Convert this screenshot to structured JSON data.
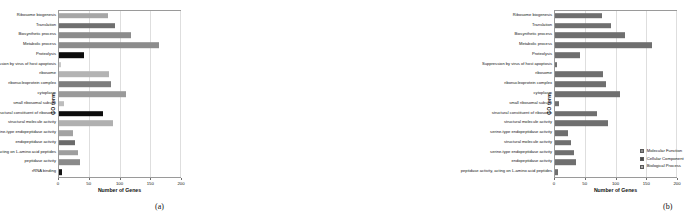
{
  "figure": {
    "panels": [
      {
        "id": "a",
        "caption": "(a)",
        "xlabel": "Number of Genes",
        "ylabel": "GO term"
      },
      {
        "id": "b",
        "caption": "(b)",
        "xlabel": "Number of Genes",
        "ylabel": "GO term"
      }
    ]
  },
  "legend": {
    "entries": [
      {
        "label": "Molecular Function",
        "color": "#8d8d8d"
      },
      {
        "label": "Cellular Component",
        "color": "#4a4a4a"
      },
      {
        "label": "Biological Process",
        "color": "#a8a8a8"
      }
    ]
  },
  "chart_data": [
    {
      "type": "bar",
      "orientation": "horizontal",
      "panel": "a",
      "title": "",
      "xlabel": "Number of Genes",
      "ylabel": "GO term",
      "xlim": [
        0,
        200
      ],
      "xticks": [
        0,
        50,
        100,
        150,
        200
      ],
      "grid": true,
      "legend_position": "none",
      "categories": [
        "Ribosome biogenesis",
        "Translation",
        "Biosynthetic process",
        "Metabolic process",
        "Proteolysis",
        "Suppression by virus of host apoptosis",
        "ribosome",
        "ribonucleoprotein complex",
        "cytoplasm",
        "small ribosomal subunit",
        "structural constituent of ribosome",
        "structural molecule activity",
        "serine-type endopeptidase activity",
        "endopeptidase activity",
        "peptidase activity, acting on L-amino acid peptides",
        "peptidase activity",
        "rRNA binding"
      ],
      "values": [
        81,
        93,
        119,
        165,
        42,
        3,
        83,
        86,
        110,
        9,
        72,
        89,
        23,
        27,
        32,
        35,
        5
      ],
      "bar_colors": [
        "#a6a6a6",
        "#6f6f6f",
        "#8c8c8c",
        "#8c8c8c",
        "#0d0d0d",
        "#c9c9c9",
        "#b3b3b3",
        "#7d7d7d",
        "#9a9a9a",
        "#bdbdbd",
        "#0d0d0d",
        "#b0b0b0",
        "#a2a2a2",
        "#6b6b6b",
        "#9e9e9e",
        "#8a8a8a",
        "#151515"
      ]
    },
    {
      "type": "bar",
      "orientation": "horizontal",
      "panel": "b",
      "title": "",
      "xlabel": "Number of Genes",
      "ylabel": "GO term",
      "xlim": [
        0,
        200
      ],
      "xticks": [
        0,
        50,
        100,
        150,
        200
      ],
      "grid": true,
      "legend_position": "lower-right",
      "categories": [
        "Ribosome biogenesis",
        "Translation",
        "Biosynthetic process",
        "Metabolic process",
        "Proteolysis",
        "Suppression by virus of host apoptosis",
        "ribosome",
        "ribonucleoprotein complex",
        "cytoplasm",
        "small ribosomal subunit",
        "structural constituent of ribosome",
        "structural molecule activity",
        "serine-type endopeptidase activity",
        "structural molecule activity",
        "serine-type endopeptidase activity",
        "endopeptidase activity",
        "peptidase activity, acting on L-amino acid peptides",
        "peptidase activity",
        "rRNA binding"
      ],
      "values": [
        78,
        92,
        116,
        160,
        41,
        4,
        80,
        84,
        108,
        7,
        70,
        87,
        22,
        26,
        31,
        34,
        5
      ],
      "bar_color": "#6f6f6f"
    }
  ]
}
